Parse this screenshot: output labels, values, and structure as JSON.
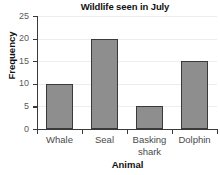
{
  "chart_data": {
    "type": "bar",
    "title": "Wildlife seen in July",
    "xlabel": "Animal",
    "ylabel": "Frequency",
    "categories": [
      "Whale",
      "Seal",
      "Basking shark",
      "Dolphin"
    ],
    "values": [
      10,
      20,
      5,
      15
    ],
    "ylim": [
      0,
      25
    ],
    "yticks": [
      0,
      5,
      10,
      15,
      20,
      25
    ],
    "ytick_labels": [
      "0",
      "5",
      "10",
      "15",
      "20",
      "25"
    ],
    "grid": "horizontal",
    "legend": "none",
    "bar_color": "#8e8e8e",
    "bar_edge_color": "#3a3a3a",
    "axis_color": "#3a3a3a",
    "gridline_color": "#ededed",
    "background_color": "#ffffff"
  }
}
